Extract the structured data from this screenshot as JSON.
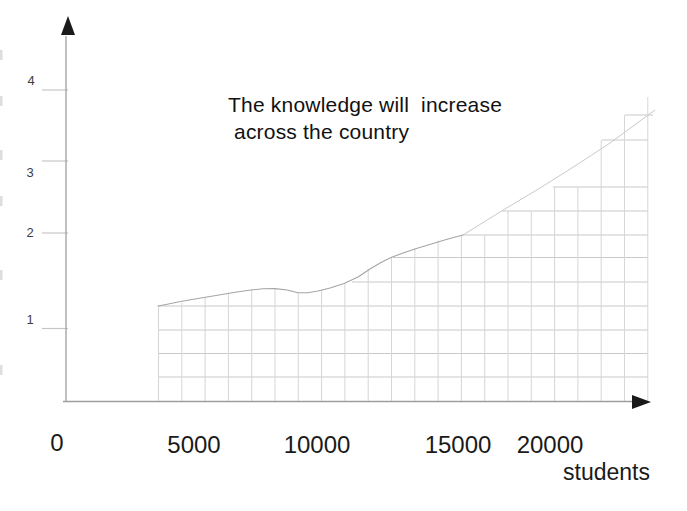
{
  "title": {
    "line1": "The knowledge will  increase",
    "line2": "across the country"
  },
  "axes": {
    "x_label": "students",
    "x_tick_labels": [
      "0",
      "5000",
      "10000",
      "15000",
      "20000"
    ],
    "y_tick_labels": [
      "4",
      "3",
      "2",
      "1"
    ]
  },
  "chart_data": {
    "type": "line",
    "title": "The knowledge will increase across the country",
    "xlabel": "students",
    "ylabel": "",
    "x_ticks": [
      0,
      5000,
      10000,
      15000,
      20000
    ],
    "y_ticks": [
      1,
      2,
      3,
      4
    ],
    "xlim": [
      0,
      24000
    ],
    "ylim": [
      0,
      4.5
    ],
    "grid": "square grid hatches only the area under the curve",
    "legend": "none",
    "series": [
      {
        "name": "knowledge level (solid curve)",
        "points": [
          [
            3600,
            1.25
          ],
          [
            5000,
            1.32
          ],
          [
            6500,
            1.42
          ],
          [
            7800,
            1.45
          ],
          [
            9000,
            1.41
          ],
          [
            9700,
            1.4
          ],
          [
            10800,
            1.52
          ],
          [
            12000,
            1.72
          ],
          [
            13200,
            1.85
          ],
          [
            14300,
            1.93
          ],
          [
            15300,
            2.0
          ]
        ]
      },
      {
        "name": "knowledge level (faint continuation)",
        "points": [
          [
            15300,
            2.0
          ],
          [
            17000,
            2.3
          ],
          [
            19000,
            2.65
          ],
          [
            21000,
            3.0
          ],
          [
            23000,
            3.35
          ]
        ]
      }
    ]
  },
  "render": {
    "width": 687,
    "height": 511,
    "colors": {
      "curve": "#a5a5a5",
      "faint_curve": "#c9c9c9",
      "h_grid": "#c9c9c9",
      "v_grid": "#d6d6d6",
      "axis": "#9e9e9e",
      "arrow": "#1a1a1a",
      "tick_stub": "#c6c6c6",
      "edge_mark": "#dedede"
    },
    "y_axis": {
      "x": 66,
      "y1": 36,
      "y2": 401.5
    },
    "x_axis": {
      "y": 401.5,
      "x1": 63,
      "x2": 638
    },
    "arrow_up": "68,16 61,35 75,35",
    "arrow_right": "651,402 632,395 632,409",
    "tick_stubs": [
      {
        "y": 90,
        "x1": 42,
        "x2": 68
      },
      {
        "y": 161,
        "x1": 42,
        "x2": 68
      },
      {
        "y": 233,
        "x1": 42,
        "x2": 68
      },
      {
        "y": 328.5,
        "x1": 42,
        "x2": 68
      }
    ],
    "edge_marks": [
      50,
      96,
      150,
      196,
      270,
      365
    ],
    "h_lines": [
      [
        306,
        158,
        648
      ],
      [
        330,
        158,
        648
      ],
      [
        353.5,
        158,
        648
      ],
      [
        377,
        158,
        648
      ],
      [
        282,
        352,
        648
      ],
      [
        257.5,
        393,
        648
      ],
      [
        235,
        463,
        648
      ],
      [
        211,
        502,
        648
      ],
      [
        187,
        553,
        648
      ],
      [
        140,
        602,
        648
      ],
      [
        115,
        625,
        653
      ]
    ],
    "v_lines": [
      [
        158.5,
        306
      ],
      [
        181.8,
        303
      ],
      [
        205.1,
        298
      ],
      [
        228.4,
        292.5
      ],
      [
        251.7,
        289.5
      ],
      [
        275.0,
        288.5
      ],
      [
        298.3,
        293
      ],
      [
        321.6,
        290
      ],
      [
        344.9,
        283.5
      ],
      [
        368.2,
        269
      ],
      [
        391.5,
        258
      ],
      [
        414.8,
        248
      ],
      [
        438.1,
        240.5
      ],
      [
        461.4,
        235.5
      ],
      [
        484.7,
        235
      ],
      [
        508.0,
        211
      ],
      [
        531.3,
        211
      ],
      [
        554.6,
        187
      ],
      [
        577.9,
        187
      ],
      [
        601.2,
        140
      ],
      [
        624.5,
        115
      ],
      [
        647.8,
        97
      ]
    ],
    "v_bottom": 401,
    "curve": [
      [
        158,
        306
      ],
      [
        166,
        304.5
      ],
      [
        178,
        302
      ],
      [
        192,
        299.5
      ],
      [
        207,
        297
      ],
      [
        222,
        294.5
      ],
      [
        237,
        292
      ],
      [
        251,
        290
      ],
      [
        263,
        288.8
      ],
      [
        275,
        288.6
      ],
      [
        287,
        290
      ],
      [
        298,
        292.8
      ],
      [
        308,
        292.8
      ],
      [
        318,
        291
      ],
      [
        330,
        288
      ],
      [
        344,
        283.5
      ],
      [
        358,
        277
      ],
      [
        370,
        269
      ],
      [
        381,
        262.5
      ],
      [
        391,
        257.5
      ],
      [
        403,
        253
      ],
      [
        418,
        248
      ],
      [
        433,
        243.5
      ],
      [
        448,
        239
      ],
      [
        463,
        235
      ]
    ],
    "faint_curve": [
      [
        463,
        235
      ],
      [
        500,
        212
      ],
      [
        540,
        188
      ],
      [
        575,
        166
      ],
      [
        610,
        143
      ],
      [
        640,
        121
      ],
      [
        655,
        110
      ]
    ]
  }
}
